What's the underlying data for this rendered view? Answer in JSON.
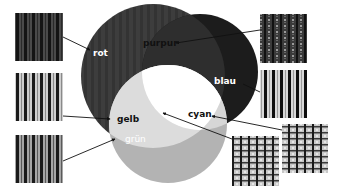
{
  "diagram": {
    "labels": {
      "rot": "rot",
      "purpur": "purpur",
      "blau": "blau",
      "gelb": "gelb",
      "cyan": "cyan",
      "gruen": "grün"
    },
    "circles": [
      {
        "name": "rot",
        "cx": 153,
        "cy": 76,
        "r": 72,
        "fill": "#3a3a3a"
      },
      {
        "name": "blau",
        "cx": 200,
        "cy": 72,
        "r": 58,
        "fill": "#1c1c1c"
      },
      {
        "name": "gruen",
        "cx": 168,
        "cy": 124,
        "r": 59,
        "fill": "#b3b3b3"
      }
    ],
    "regions": {
      "purpur_fill": "#2e2e2e",
      "gelb_fill": "#dcdcdc",
      "cyan_fill": "#d6d6d6",
      "weiss_fill": "#ffffff"
    },
    "swatches": [
      {
        "name": "rot-swatch",
        "x": 15,
        "y": 13,
        "w": 48,
        "h": 48,
        "pattern": "dark-stripes"
      },
      {
        "name": "gelb-swatch",
        "x": 15,
        "y": 73,
        "w": 48,
        "h": 48,
        "pattern": "light-stripes"
      },
      {
        "name": "gruen-swatch",
        "x": 15,
        "y": 135,
        "w": 48,
        "h": 48,
        "pattern": "gray-stripes"
      },
      {
        "name": "purpur-swatch",
        "x": 260,
        "y": 14,
        "w": 47,
        "h": 49,
        "pattern": "dark-dotted"
      },
      {
        "name": "blau-swatch",
        "x": 260,
        "y": 70,
        "w": 47,
        "h": 48,
        "pattern": "contrast-stripes"
      },
      {
        "name": "cyan-swatch",
        "x": 282,
        "y": 124,
        "w": 46,
        "h": 49,
        "pattern": "checker-stripes"
      },
      {
        "name": "weiss-swatch",
        "x": 232,
        "y": 136,
        "w": 47,
        "h": 50,
        "pattern": "checker-stripes"
      }
    ]
  }
}
